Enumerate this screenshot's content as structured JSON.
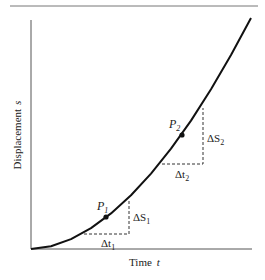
{
  "figure": {
    "type": "displacement-time curve",
    "x_axis_label": "Time",
    "x_axis_symbol": "t",
    "y_axis_label": "Displacement",
    "y_axis_symbol": "s",
    "points": [
      {
        "name": "P",
        "sub": "1",
        "x": 106,
        "y": 217
      },
      {
        "name": "P",
        "sub": "2",
        "x": 182,
        "y": 135
      }
    ],
    "intervals": [
      {
        "dt_label": "Δt",
        "dt_sub": "1",
        "ds_label": "ΔS",
        "ds_sub": "1",
        "left": [
          84,
          234
        ],
        "corner": [
          129,
          234
        ],
        "top": [
          129,
          201
        ]
      },
      {
        "dt_label": "Δt",
        "dt_sub": "2",
        "ds_label": "ΔS",
        "ds_sub": "2",
        "left": [
          162,
          164
        ],
        "corner": [
          203,
          164
        ],
        "top": [
          203,
          108
        ]
      }
    ],
    "curve_points": [
      [
        31,
        249
      ],
      [
        51,
        246.3
      ],
      [
        71,
        239.1
      ],
      [
        91,
        228.1
      ],
      [
        111,
        213.4
      ],
      [
        131,
        195.3
      ],
      [
        151,
        173.6
      ],
      [
        171,
        148.7
      ],
      [
        191,
        120.6
      ],
      [
        211,
        89.3
      ],
      [
        231,
        55
      ],
      [
        251,
        18
      ]
    ],
    "colors": {
      "curve": "#111111",
      "axis": "#555555",
      "dash": "#333333",
      "rule": "#777777"
    }
  }
}
